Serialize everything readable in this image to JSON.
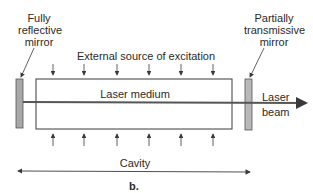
{
  "labels": {
    "left_mirror": [
      "Fully",
      "reflective",
      "mirror"
    ],
    "right_mirror": [
      "Partially",
      "transmissive",
      "mirror"
    ],
    "excitation": "External source of excitation",
    "medium": "Laser medium",
    "beam": [
      "Laser",
      "beam"
    ],
    "cavity": "Cavity",
    "caption": "b."
  },
  "colors": {
    "line": "#3a3a3a",
    "mirror_fill": "#a8a8a8",
    "beam": "#555555"
  },
  "excitation_arrows_x": [
    53,
    84,
    117,
    149,
    181,
    213
  ]
}
